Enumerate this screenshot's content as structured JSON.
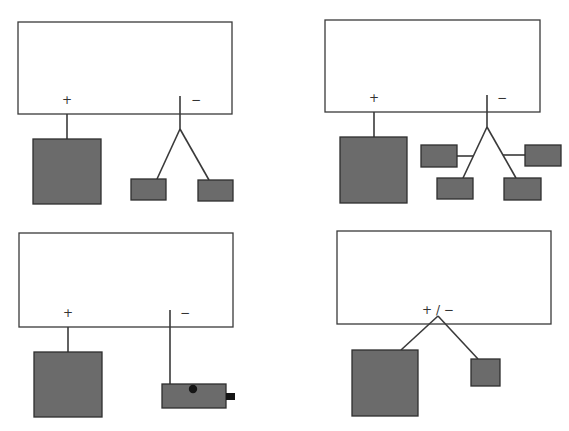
{
  "colors": {
    "frame_stroke": "#3a3a3a",
    "block_fill": "#6b6b6b",
    "block_stroke": "#2e2e2e",
    "connector": "#151515",
    "background": "#ffffff"
  },
  "panels": [
    {
      "id": "top-left",
      "plus_label": "+",
      "minus_label": "−",
      "description": "Positive terminal to one large block; negative terminal splits to two small blocks"
    },
    {
      "id": "top-right",
      "plus_label": "+",
      "minus_label": "−",
      "description": "Positive terminal to one large block; negative terminal splits to four small blocks"
    },
    {
      "id": "bottom-left",
      "plus_label": "+",
      "minus_label": "−",
      "description": "Positive terminal to one large block; negative terminal to a small device with a dot and connector tab"
    },
    {
      "id": "bottom-right",
      "combined_label": "+ / −",
      "description": "Single combined terminal splitting to one large block and one small block"
    }
  ]
}
